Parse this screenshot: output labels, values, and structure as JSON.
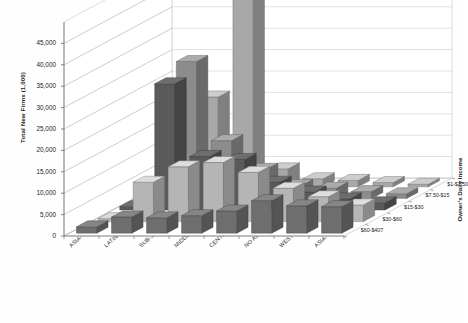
{
  "chart_data": {
    "type": "bar",
    "title": "",
    "subtitle": "",
    "ylabel": "Total New Firms (1,000)",
    "xlabel": "",
    "zlabel": "Owner's Daily Income",
    "ylim": [
      0,
      45000
    ],
    "ytick_step": 5000,
    "yticks": [
      "0",
      "5,000",
      "10,000",
      "15,000",
      "20,000",
      "25,000",
      "30,000",
      "35,000",
      "40,000",
      "45,000"
    ],
    "grid": true,
    "legend_position": "right-depth-axis",
    "projection": "3d-column",
    "categories": [
      "ASIA- DEVELOPING",
      "LATIN AMERICA-CARIBB",
      "SUB-SAHARA AFRICA",
      "MIDDLE EAST,NO AFRIC",
      "CENTRAL,EAST EUROPE",
      "NO AMER., OCEANIA",
      "WEST EUROPE, ISRAEL",
      "ASIA- DEVELOPED"
    ],
    "series": [
      {
        "name": "$1-$7.50",
        "color": "#a8a8a8",
        "values": [
          1100,
          21000,
          48000,
          4200,
          1900,
          1500,
          1000,
          600
        ]
      },
      {
        "name": "$7.50-$15",
        "color": "#8c8c8c",
        "values": [
          900,
          32000,
          13500,
          6800,
          3000,
          2400,
          1600,
          1100
        ]
      },
      {
        "name": "$15-$30",
        "color": "#5a5a5a",
        "values": [
          800,
          29500,
          12500,
          11800,
          6500,
          4200,
          2600,
          1700
        ]
      },
      {
        "name": "$30-$60",
        "color": "#b5b5b5",
        "values": [
          700,
          9200,
          12800,
          13800,
          11500,
          7800,
          5800,
          3900
        ]
      },
      {
        "name": "$60-$407",
        "color": "#6e6e6e",
        "values": [
          1500,
          3800,
          3600,
          4100,
          5200,
          7600,
          6400,
          6200
        ]
      }
    ]
  },
  "axes": {
    "y_title": "Total New Firms (1,000)",
    "z_title": "Owner's Daily Income"
  }
}
